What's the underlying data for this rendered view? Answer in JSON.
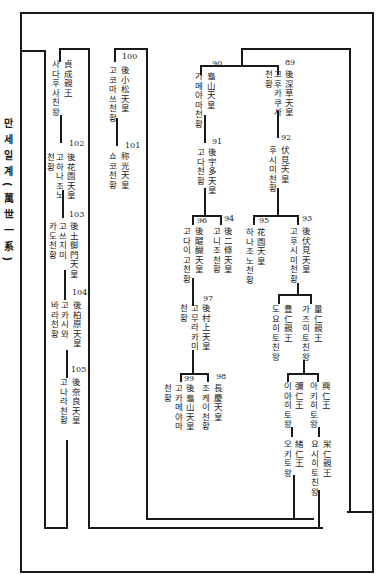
{
  "title": "만세일계(萬世一系)",
  "nodes": {
    "n89": {
      "number": "89",
      "kanji": "後深草天皇",
      "korean": "고후카쿠사",
      "korean2": "천황"
    },
    "n90": {
      "number": "90",
      "kanji": "龜山天皇",
      "korean": "가메야마천황"
    },
    "n91": {
      "number": "91",
      "kanji": "後宇多天皇",
      "korean": "고다천황"
    },
    "n92": {
      "number": "92",
      "kanji": "伏見天皇",
      "korean": "후시미천황"
    },
    "n93": {
      "number": "93",
      "kanji": "後伏見天皇",
      "korean": "고후시미천황"
    },
    "n94": {
      "number": "94",
      "kanji": "後二條天皇",
      "korean": "고니조천황"
    },
    "n95": {
      "number": "95",
      "kanji": "花園天皇",
      "korean": "하나조노천황"
    },
    "n96": {
      "number": "96",
      "kanji": "後醍醐天皇",
      "korean": "고다이고천황"
    },
    "n97": {
      "number": "97",
      "kanji": "後村上天皇",
      "korean": "고무라카미",
      "korean2": "천황"
    },
    "n98": {
      "number": "98",
      "kanji": "長慶天皇",
      "korean": "조케이천황"
    },
    "n99": {
      "number": "99",
      "kanji": "後龜山天皇",
      "korean": "고카메야마",
      "korean2": "천황"
    },
    "n100": {
      "number": "100",
      "kanji": "後小松天皇",
      "korean": "고코마쓰천황"
    },
    "n101": {
      "number": "101",
      "kanji": "称光天皇",
      "korean": "쇼코천황"
    },
    "n102": {
      "number": "102",
      "kanji": "後花園天皇",
      "korean": "고하나조노",
      "korean2": "천황"
    },
    "n103": {
      "number": "103",
      "kanji": "後土御門天皇",
      "korean": "고쓰치미",
      "korean2": "카도천황"
    },
    "n104": {
      "number": "104",
      "kanji": "後柏原天皇",
      "korean": "고카시와",
      "korean2": "바라천황"
    },
    "n105": {
      "number": "105",
      "kanji": "後奈良天皇",
      "korean": "고나라천황"
    },
    "sadafusa": {
      "kanji": "貞成親王",
      "korean": "사다후사친왕"
    },
    "toyohito": {
      "kanji": "豊仁親王",
      "korean": "도요히토친왕"
    },
    "kazuhito": {
      "kanji": "量仁親王",
      "korean": "가즈히토친왕"
    },
    "iyahito": {
      "kanji": "彌仁王",
      "korean": "이야히토왕"
    },
    "akihito": {
      "kanji": "興仁王",
      "korean": "아키히토왕"
    },
    "okihito": {
      "kanji": "緒仁王",
      "korean": "오키토왕"
    },
    "yoshihito": {
      "kanji": "栄仁親王",
      "korean": "요시히토친왕"
    }
  }
}
